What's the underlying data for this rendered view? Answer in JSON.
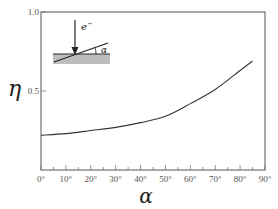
{
  "chart_data": {
    "type": "line",
    "title": "",
    "xlabel": "α",
    "ylabel": "η",
    "xlim": [
      0,
      90
    ],
    "ylim": [
      0,
      1.0
    ],
    "x_ticks": [
      0,
      10,
      20,
      30,
      40,
      50,
      60,
      70,
      80,
      90
    ],
    "x_tick_labels": [
      "0°",
      "10°",
      "20°",
      "30°",
      "40°",
      "50°",
      "60°",
      "70°",
      "80°",
      "90°"
    ],
    "x_minor_tick_step": 5,
    "y_ticks": [
      0.5,
      1.0
    ],
    "y_tick_labels": [
      "0.5",
      "1.0"
    ],
    "grid": false,
    "legend": null,
    "series": [
      {
        "name": "η(α)",
        "color": "#333333",
        "x": [
          0,
          10,
          20,
          30,
          40,
          50,
          60,
          70,
          80,
          85
        ],
        "values": [
          0.22,
          0.23,
          0.25,
          0.27,
          0.3,
          0.34,
          0.42,
          0.51,
          0.63,
          0.69
        ]
      }
    ],
    "inset": {
      "description": "Electron beam incident vertically on a tilted surface at angle α",
      "beam_label": "e⁻",
      "angle_label": "α"
    }
  },
  "labels": {
    "x_axis": "α",
    "y_axis": "η",
    "beam": "e",
    "beam_sup": "−",
    "angle": "α"
  }
}
